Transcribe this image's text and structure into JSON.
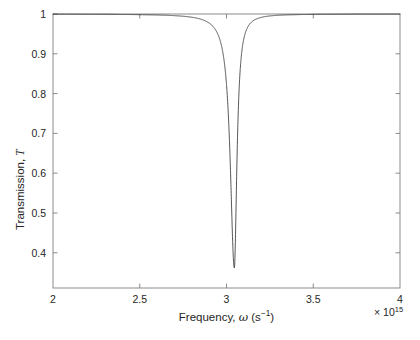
{
  "chart_data": {
    "type": "line",
    "title": "",
    "xlabel": "Frequency, ω (s⁻¹)",
    "ylabel": "Transmission, T",
    "x_exponent_label": "× 10¹⁵",
    "x_exponent": 15,
    "xlim": [
      2,
      4
    ],
    "ylim": [
      0.3115,
      1.0
    ],
    "xticks": [
      2,
      2.5,
      3,
      3.5,
      4
    ],
    "xtick_labels": [
      "2",
      "2.5",
      "3",
      "3.5",
      "4"
    ],
    "yticks": [
      0.4,
      0.5,
      0.6,
      0.7,
      0.8,
      0.9,
      1
    ],
    "ytick_labels": [
      "0.4",
      "0.5",
      "0.6",
      "0.7",
      "0.8",
      "0.9",
      "1"
    ],
    "grid": false,
    "legend": null,
    "line_color": "#2b2b2b",
    "line_width": 0.8,
    "axis_color": "#7f7f7f",
    "background": "#ffffff",
    "resonance_center": 3.045,
    "resonance_min_value": 0.362,
    "resonance_halfwidth": 0.018,
    "asymmetry": 0.55,
    "baseline": 1.0,
    "series": [
      {
        "name": "Transmission",
        "x": [
          2.0,
          2.1,
          2.2,
          2.3,
          2.4,
          2.5,
          2.6,
          2.7,
          2.8,
          2.85,
          2.9,
          2.93,
          2.95,
          2.97,
          2.985,
          3.0,
          3.01,
          3.02,
          3.028,
          3.034,
          3.038,
          3.042,
          3.045,
          3.048,
          3.052,
          3.056,
          3.062,
          3.07,
          3.08,
          3.09,
          3.1,
          3.12,
          3.15,
          3.2,
          3.3,
          3.4,
          3.5,
          3.6,
          3.7,
          3.8,
          3.9,
          4.0
        ],
        "y": [
          1.0,
          1.0,
          1.0,
          1.0,
          0.999,
          0.999,
          0.998,
          0.997,
          0.995,
          0.993,
          0.989,
          0.985,
          0.981,
          0.973,
          0.963,
          0.944,
          0.925,
          0.889,
          0.83,
          0.71,
          0.6,
          0.44,
          0.362,
          0.45,
          0.64,
          0.79,
          0.89,
          0.945,
          0.97,
          0.981,
          0.987,
          0.992,
          0.995,
          0.997,
          0.999,
          0.999,
          1.0,
          1.0,
          1.0,
          1.0,
          1.0,
          1.0
        ]
      }
    ]
  },
  "axes": {
    "box_left_px": 53,
    "box_top_px": 14,
    "box_right_px": 400,
    "box_bottom_px": 288
  }
}
